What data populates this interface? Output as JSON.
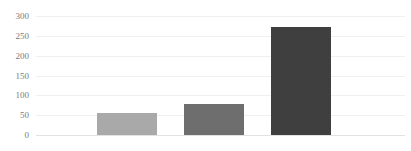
{
  "chart_data": {
    "type": "bar",
    "title": "",
    "subtitle": "",
    "xlabel": "",
    "ylabel": "",
    "categories": [
      "",
      "",
      ""
    ],
    "values": [
      55,
      78,
      272
    ],
    "series": [
      {
        "name": "",
        "values": [
          55,
          78,
          272
        ],
        "colors": [
          "#a9a9a9",
          "#6e6e6e",
          "#3f3f3f"
        ]
      }
    ],
    "ylim": [
      0,
      300
    ],
    "ytick_labels": [
      "300",
      "250",
      "200",
      "150",
      "100",
      "50",
      "0"
    ],
    "ytick_values": [
      300,
      250,
      200,
      150,
      100,
      50,
      0
    ],
    "xtick_labels": [],
    "grid": true,
    "grid_axis": "y",
    "legend": false,
    "legend_position": "none",
    "annotations": [],
    "colors": {
      "background": "#ffffff",
      "gridline": "#f0f0f0",
      "baseline": "#e2e2e2",
      "tick_label": "#7b7b7b",
      "bar_1": "#a9a9a9",
      "bar_2": "#6e6e6e",
      "bar_3": "#3f3f3f"
    }
  }
}
